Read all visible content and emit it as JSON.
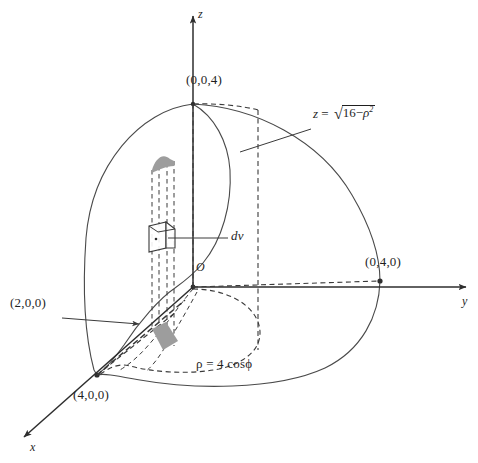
{
  "figure": {
    "kind": "3d-coordinate-diagram",
    "background_color": "#ffffff",
    "stroke_color": "#3a3a3a",
    "shade_color": "#9a9a9a"
  },
  "axes": {
    "x_label": "x",
    "y_label": "y",
    "z_label": "z",
    "origin_label": "O"
  },
  "points": {
    "z_intercept": "(0,0,4)",
    "y_intercept": "(0,4,0)",
    "x_intercept": "(4,0,0)",
    "x_midpoint": "(2,0,0)"
  },
  "annotations": {
    "surface_equation": {
      "lhs": "z",
      "equals": "=",
      "radicand_head": "16",
      "radicand_minus": "−",
      "radicand_symbol": "ρ",
      "radicand_exponent": "2"
    },
    "volume_element": "dv",
    "polar_curve": "ρ = 4 cosϕ"
  }
}
